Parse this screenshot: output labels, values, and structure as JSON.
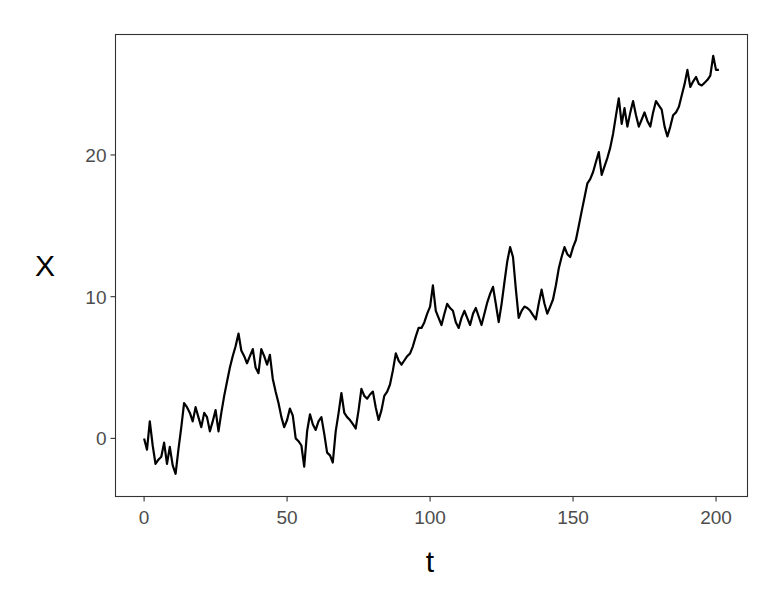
{
  "chart_data": {
    "type": "line",
    "title": "",
    "xlabel": "t",
    "ylabel": "X",
    "xlim": [
      -10,
      211
    ],
    "ylim": [
      -4.1,
      28.5
    ],
    "x_ticks": [
      0,
      50,
      100,
      150,
      200
    ],
    "x_tick_labels": [
      "0",
      "50",
      "100",
      "150",
      "200"
    ],
    "y_ticks": [
      0,
      10,
      20
    ],
    "y_tick_labels": [
      "0",
      "10",
      "20"
    ],
    "grid": false,
    "legend": null,
    "series": [
      {
        "name": "X",
        "color": "#000000",
        "x": [
          0,
          1,
          2,
          3,
          4,
          5,
          6,
          7,
          8,
          9,
          10,
          11,
          12,
          13,
          14,
          15,
          16,
          17,
          18,
          19,
          20,
          21,
          22,
          23,
          24,
          25,
          26,
          27,
          28,
          29,
          30,
          31,
          32,
          33,
          34,
          35,
          36,
          37,
          38,
          39,
          40,
          41,
          42,
          43,
          44,
          45,
          46,
          47,
          48,
          49,
          50,
          51,
          52,
          53,
          54,
          55,
          56,
          57,
          58,
          59,
          60,
          61,
          62,
          63,
          64,
          65,
          66,
          67,
          68,
          69,
          70,
          71,
          72,
          73,
          74,
          75,
          76,
          77,
          78,
          79,
          80,
          81,
          82,
          83,
          84,
          85,
          86,
          87,
          88,
          89,
          90,
          91,
          92,
          93,
          94,
          95,
          96,
          97,
          98,
          99,
          100,
          101,
          102,
          103,
          104,
          105,
          106,
          107,
          108,
          109,
          110,
          111,
          112,
          113,
          114,
          115,
          116,
          117,
          118,
          119,
          120,
          121,
          122,
          123,
          124,
          125,
          126,
          127,
          128,
          129,
          130,
          131,
          132,
          133,
          134,
          135,
          136,
          137,
          138,
          139,
          140,
          141,
          142,
          143,
          144,
          145,
          146,
          147,
          148,
          149,
          150,
          151,
          152,
          153,
          154,
          155,
          156,
          157,
          158,
          159,
          160,
          161,
          162,
          163,
          164,
          165,
          166,
          167,
          168,
          169,
          170,
          171,
          172,
          173,
          174,
          175,
          176,
          177,
          178,
          179,
          180,
          181,
          182,
          183,
          184,
          185,
          186,
          187,
          188,
          189,
          190,
          191,
          192,
          193,
          194,
          195,
          196,
          197,
          198,
          199,
          200,
          201
        ],
        "values": [
          0.0,
          -0.8,
          1.2,
          -0.5,
          -1.8,
          -1.5,
          -1.3,
          -0.3,
          -1.8,
          -0.6,
          -1.9,
          -2.5,
          -0.8,
          0.8,
          2.5,
          2.2,
          1.8,
          1.2,
          2.2,
          1.5,
          0.8,
          1.8,
          1.5,
          0.5,
          1.2,
          2.0,
          0.5,
          1.8,
          3.0,
          4.0,
          5.0,
          5.8,
          6.5,
          7.4,
          6.2,
          5.8,
          5.3,
          5.8,
          6.3,
          5.0,
          4.6,
          6.3,
          5.8,
          5.2,
          5.9,
          4.2,
          3.3,
          2.5,
          1.5,
          0.8,
          1.3,
          2.1,
          1.6,
          0.0,
          -0.2,
          -0.5,
          -2.0,
          0.5,
          1.7,
          1.0,
          0.6,
          1.2,
          1.5,
          0.3,
          -1.0,
          -1.2,
          -1.7,
          0.5,
          1.8,
          3.2,
          1.8,
          1.5,
          1.3,
          1.0,
          0.7,
          2.0,
          3.5,
          3.0,
          2.8,
          3.1,
          3.3,
          2.2,
          1.3,
          2.0,
          3.0,
          3.3,
          3.8,
          4.8,
          6.0,
          5.5,
          5.2,
          5.5,
          5.8,
          6.0,
          6.5,
          7.2,
          7.8,
          7.8,
          8.2,
          8.8,
          9.3,
          10.8,
          9.0,
          8.5,
          8.0,
          8.8,
          9.5,
          9.2,
          9.0,
          8.2,
          7.8,
          8.5,
          9.0,
          8.5,
          8.0,
          8.8,
          9.2,
          8.6,
          8.0,
          8.8,
          9.6,
          10.2,
          10.7,
          9.5,
          8.2,
          9.5,
          11.0,
          12.5,
          13.5,
          12.8,
          10.5,
          8.5,
          9.0,
          9.3,
          9.2,
          9.0,
          8.7,
          8.4,
          9.5,
          10.5,
          9.5,
          8.8,
          9.3,
          9.8,
          10.8,
          12.0,
          12.8,
          13.5,
          13.0,
          12.8,
          13.5,
          14.0,
          15.0,
          16.0,
          17.0,
          18.0,
          18.3,
          18.8,
          19.5,
          20.2,
          18.6,
          19.2,
          19.8,
          20.5,
          21.5,
          22.8,
          24.0,
          22.2,
          23.3,
          22.0,
          23.0,
          23.8,
          22.8,
          22.0,
          22.5,
          23.0,
          22.4,
          22.0,
          23.0,
          23.8,
          23.5,
          23.2,
          22.0,
          21.3,
          22.0,
          22.8,
          23.0,
          23.4,
          24.2,
          25.0,
          26.0,
          24.8,
          25.2,
          25.5,
          25.0,
          24.9,
          25.1,
          25.3,
          25.6,
          27.0,
          26.0,
          26.0
        ]
      }
    ]
  },
  "axes": {
    "x_title": "t",
    "y_title": "X"
  }
}
